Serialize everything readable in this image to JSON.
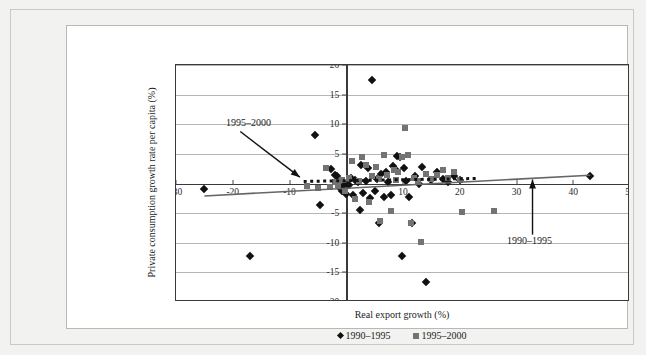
{
  "chart_data": {
    "type": "scatter",
    "title": "",
    "xlabel": "Real export growth (%)",
    "ylabel": "Private consumption growth rate per capita (%)",
    "xlim": [
      -30,
      50
    ],
    "ylim": [
      -20,
      20
    ],
    "xticks": [
      -30,
      -20,
      -10,
      0,
      10,
      20,
      30,
      40,
      50
    ],
    "xtick_labels": [
      "-30",
      "-20",
      "-10",
      "0",
      "10",
      "20",
      "30",
      "40",
      "50"
    ],
    "yticks": [
      -20,
      -15,
      -10,
      -5,
      0,
      5,
      10,
      15,
      20
    ],
    "ytick_labels": [
      "-20",
      "-15",
      "-10",
      "-5",
      "0",
      "5",
      "10",
      "15",
      "20"
    ],
    "grid": "horizontal",
    "legend_position": "bottom-center",
    "series": [
      {
        "name": "1990–1995",
        "marker": "diamond",
        "color": "#111111",
        "points": [
          [
            -25.0,
            -1.0
          ],
          [
            -17.0,
            -12.2
          ],
          [
            -5.5,
            8.2
          ],
          [
            -4.6,
            -3.6
          ],
          [
            -2.6,
            2.4
          ],
          [
            -2.0,
            1.4
          ],
          [
            -1.6,
            1.3
          ],
          [
            -1.2,
            -0.6
          ],
          [
            -0.8,
            -1.3
          ],
          [
            -0.4,
            -0.3
          ],
          [
            0.0,
            -1.8
          ],
          [
            0.4,
            -0.2
          ],
          [
            0.8,
            1.0
          ],
          [
            1.2,
            -2.0
          ],
          [
            1.6,
            0.6
          ],
          [
            2.0,
            0.2
          ],
          [
            2.4,
            -4.4
          ],
          [
            2.6,
            3.2
          ],
          [
            3.0,
            -1.6
          ],
          [
            3.4,
            0.4
          ],
          [
            3.8,
            2.6
          ],
          [
            4.2,
            -2.4
          ],
          [
            4.6,
            17.5
          ],
          [
            5.0,
            -1.2
          ],
          [
            5.4,
            0.8
          ],
          [
            5.8,
            -6.6
          ],
          [
            6.2,
            1.6
          ],
          [
            6.6,
            -2.2
          ],
          [
            7.0,
            2.0
          ],
          [
            7.4,
            0.2
          ],
          [
            7.8,
            -2.0
          ],
          [
            8.2,
            3.0
          ],
          [
            8.6,
            2.4
          ],
          [
            9.0,
            4.6
          ],
          [
            9.4,
            4.4
          ],
          [
            9.8,
            -12.2
          ],
          [
            10.2,
            2.6
          ],
          [
            10.6,
            0.4
          ],
          [
            11.0,
            -2.2
          ],
          [
            11.6,
            -6.6
          ],
          [
            12.2,
            1.2
          ],
          [
            12.8,
            0.0
          ],
          [
            13.4,
            2.8
          ],
          [
            14.0,
            -16.6
          ],
          [
            15.0,
            0.6
          ],
          [
            16.0,
            2.0
          ],
          [
            17.0,
            0.8
          ],
          [
            18.0,
            0.2
          ],
          [
            19.0,
            1.2
          ],
          [
            20.0,
            0.6
          ],
          [
            43.0,
            1.3
          ]
        ]
      },
      {
        "name": "1995–2000",
        "marker": "square",
        "color": "#737373",
        "points": [
          [
            -7.0,
            -0.4
          ],
          [
            -5.0,
            -0.8
          ],
          [
            -3.6,
            2.6
          ],
          [
            -2.8,
            -0.6
          ],
          [
            -2.0,
            0.2
          ],
          [
            -1.4,
            -0.2
          ],
          [
            -0.8,
            0.6
          ],
          [
            -0.2,
            -1.2
          ],
          [
            0.4,
            1.0
          ],
          [
            1.0,
            3.8
          ],
          [
            1.6,
            -2.6
          ],
          [
            2.2,
            0.4
          ],
          [
            2.8,
            4.4
          ],
          [
            3.4,
            3.2
          ],
          [
            4.0,
            -3.2
          ],
          [
            4.6,
            1.2
          ],
          [
            5.2,
            2.8
          ],
          [
            5.8,
            0.8
          ],
          [
            6.0,
            -6.4
          ],
          [
            6.6,
            4.8
          ],
          [
            7.2,
            1.4
          ],
          [
            7.8,
            -4.6
          ],
          [
            8.4,
            2.2
          ],
          [
            8.8,
            0.6
          ],
          [
            9.2,
            2.0
          ],
          [
            9.8,
            4.4
          ],
          [
            10.4,
            9.4
          ],
          [
            10.8,
            4.8
          ],
          [
            11.4,
            -6.6
          ],
          [
            12.0,
            1.0
          ],
          [
            12.6,
            0.4
          ],
          [
            13.2,
            -9.8
          ],
          [
            14.0,
            1.6
          ],
          [
            15.0,
            0.8
          ],
          [
            16.0,
            1.4
          ],
          [
            17.0,
            2.2
          ],
          [
            18.0,
            1.0
          ],
          [
            19.0,
            2.0
          ],
          [
            20.0,
            0.6
          ],
          [
            20.4,
            -4.8
          ],
          [
            26.0,
            -4.7
          ]
        ]
      }
    ],
    "trendlines": [
      {
        "name": "1990–1995",
        "style": "solid",
        "color": "#666666",
        "x0": -25.0,
        "y0": -2.1,
        "x1": 43.0,
        "y1": 1.4
      },
      {
        "name": "1995–2000",
        "style": "dotted",
        "color": "#111111",
        "x0": -7.5,
        "y0": 0.35,
        "x1": 23.0,
        "y1": 0.85
      }
    ],
    "annotations": [
      {
        "label": "1995–2000",
        "text_x": -21.0,
        "text_y": 9.8,
        "arrow_to_x": -8.0,
        "arrow_to_y": 0.9
      },
      {
        "label": "1990–1995",
        "text_x": 28.5,
        "text_y": -10.0,
        "arrow_to_x": 33.0,
        "arrow_to_y": 0.5
      }
    ],
    "legend": [
      {
        "label": "1990–1995",
        "marker": "diamond",
        "color": "#111111"
      },
      {
        "label": "1995–2000",
        "marker": "square",
        "color": "#737373"
      }
    ]
  },
  "colors": {
    "page_background": "#f2f2f0",
    "panel_background": "#ffffff",
    "axis": "#3a3a3a",
    "grid": "#b5b5b5",
    "series_1990_1995": "#111111",
    "series_1995_2000": "#737373",
    "trend_solid": "#666666",
    "trend_dotted": "#111111",
    "text": "#1c1c1c"
  }
}
